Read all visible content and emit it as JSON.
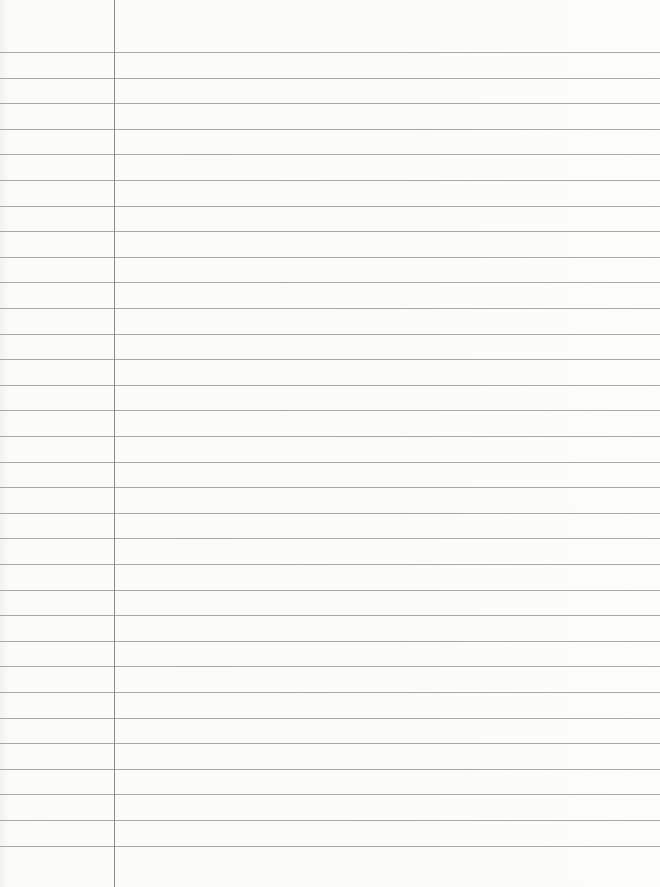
{
  "paper": {
    "type": "lined-paper",
    "line_count": 32,
    "first_line_y": 52,
    "line_spacing": 25.6,
    "margin_x": 114,
    "colors": {
      "background": "#fbfbfa",
      "rule": "#a9a9a9",
      "margin": "#8a8a8a"
    }
  }
}
